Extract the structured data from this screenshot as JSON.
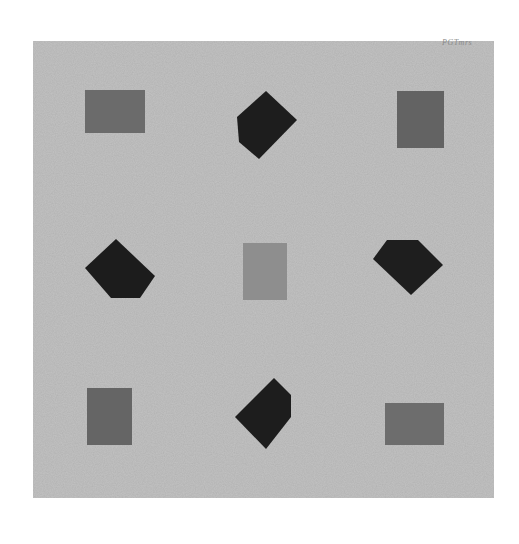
{
  "artwork": {
    "background_color": "#ffffff",
    "canvas": {
      "x": 33,
      "y": 41,
      "width": 461,
      "height": 457,
      "color": "#c3c3c3"
    },
    "signature": "PGTmrs",
    "colors": {
      "gray_rect": "#6a6a6a",
      "center_rect": "#8d8d8d",
      "black_polygon": "#1d1d1d"
    },
    "shapes": [
      {
        "name": "top-left-rectangle",
        "type": "rect",
        "x": 85,
        "y": 90,
        "w": 60,
        "h": 43,
        "color": "#6b6b6b"
      },
      {
        "name": "top-center-polygon",
        "type": "polygon",
        "points": "266,91 297,120 259,159 239,142 237,117",
        "color": "#1d1d1d"
      },
      {
        "name": "top-right-rectangle",
        "type": "rect",
        "x": 397,
        "y": 91,
        "w": 47,
        "h": 57,
        "color": "#636363"
      },
      {
        "name": "middle-left-polygon",
        "type": "polygon",
        "points": "116,239 155,276 140,298 111,298 85,268",
        "color": "#1c1c1c"
      },
      {
        "name": "center-rectangle",
        "type": "rect",
        "x": 243,
        "y": 243,
        "w": 44,
        "h": 57,
        "color": "#8e8e8e"
      },
      {
        "name": "middle-right-polygon",
        "type": "polygon",
        "points": "387,240 418,240 443,265 411,295 373,259",
        "color": "#1e1e1e"
      },
      {
        "name": "bottom-left-rectangle",
        "type": "rect",
        "x": 87,
        "y": 388,
        "w": 45,
        "h": 57,
        "color": "#656565"
      },
      {
        "name": "bottom-center-polygon",
        "type": "polygon",
        "points": "274,378 291,395 291,417 266,449 235,417",
        "color": "#1d1d1d"
      },
      {
        "name": "bottom-right-rectangle",
        "type": "rect",
        "x": 385,
        "y": 403,
        "w": 59,
        "h": 42,
        "color": "#6d6d6d"
      }
    ]
  }
}
